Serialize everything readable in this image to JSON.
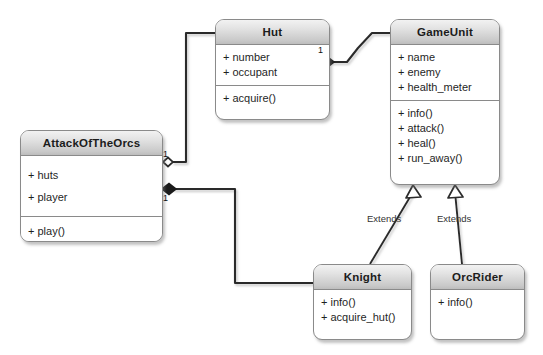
{
  "diagram": {
    "background_color": "#ffffff",
    "line_color": "#2b2b2b",
    "header_color": "#d2d2d2",
    "border_color": "#8a8a8a"
  },
  "classes": [
    {
      "id": "hut",
      "name": "Hut",
      "attributes": [
        "+ number",
        "+ occupant"
      ],
      "methods": [
        "+ acquire()"
      ]
    },
    {
      "id": "gameunit",
      "name": "GameUnit",
      "attributes": [
        "+ name",
        "+ enemy",
        "+ health_meter"
      ],
      "methods": [
        "+ info()",
        "+ attack()",
        "+ heal()",
        "+ run_away()"
      ]
    },
    {
      "id": "attackoftheorcs",
      "name": "AttackOfTheOrcs",
      "attributes": [
        "+ huts",
        "+ player"
      ],
      "methods": [
        "+ play()"
      ]
    },
    {
      "id": "knight",
      "name": "Knight",
      "attributes": [],
      "methods": [
        "+ info()",
        "+ acquire_hut()"
      ]
    },
    {
      "id": "orcrider",
      "name": "OrcRider",
      "attributes": [],
      "methods": [
        "+ info()"
      ]
    }
  ],
  "relationships": [
    {
      "id": "orcs-hut",
      "from": "attackoftheorcs",
      "to": "hut",
      "type": "aggregation",
      "marker": "hollow-diamond",
      "multiplicity": "1",
      "label": ""
    },
    {
      "id": "orcs-knight",
      "from": "attackoftheorcs",
      "to": "knight",
      "type": "composition",
      "marker": "filled-diamond",
      "multiplicity": "1",
      "label": ""
    },
    {
      "id": "hut-gameunit",
      "from": "hut",
      "to": "gameunit",
      "type": "composition",
      "marker": "filled-diamond",
      "multiplicity": "1",
      "label": ""
    },
    {
      "id": "knight-gameunit",
      "from": "knight",
      "to": "gameunit",
      "type": "inheritance",
      "marker": "hollow-triangle",
      "multiplicity": "",
      "label": "Extends"
    },
    {
      "id": "orcrider-gameunit",
      "from": "orcrider",
      "to": "gameunit",
      "type": "inheritance",
      "marker": "hollow-triangle",
      "multiplicity": "",
      "label": "Extends"
    }
  ],
  "multiplicity_labels": {
    "orcs_hut": "1",
    "orcs_knight": "1",
    "hut_gameunit": "1"
  },
  "extends_labels": {
    "knight": "Extends",
    "orcrider": "Extends"
  }
}
